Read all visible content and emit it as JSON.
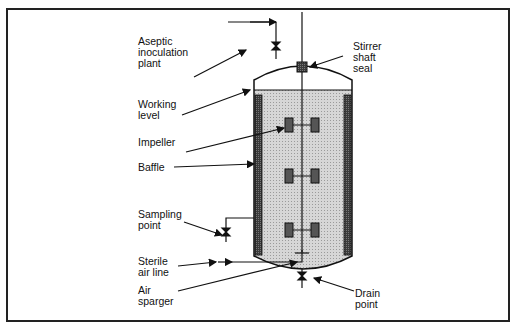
{
  "labels": {
    "aseptic_inoculation": "Aseptic\ninoculation\nplant",
    "working_level": "Working\nlevel",
    "impeller": "Impeller",
    "baffle": "Baffle",
    "sampling_point": "Sampling\npoint",
    "sterile_air_line": "Sterile\nair  line",
    "air_sparger": "Air\nsparger",
    "stirrer_shaft_seal": "Stirrer\nshaft\nseal",
    "drain_point": "Drain\npoint"
  },
  "colors": {
    "line": "#111111",
    "liquid": "#cfcfcf",
    "baffle": "#3a3a3a",
    "impeller": "#555555"
  }
}
